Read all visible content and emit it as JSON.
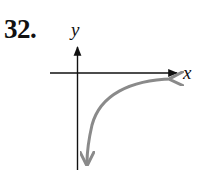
{
  "problem": {
    "number": "32."
  },
  "graph": {
    "x_axis_label": "x",
    "y_axis_label": "y",
    "axis_color": "#111111",
    "curve_color": "#8a8a8a",
    "curve_description": "Decreasing-magnitude branch in quadrant IV: approaches x-axis from below as x increases, approaches y-axis (vertical asymptote) downward as x approaches 0 from the right"
  }
}
